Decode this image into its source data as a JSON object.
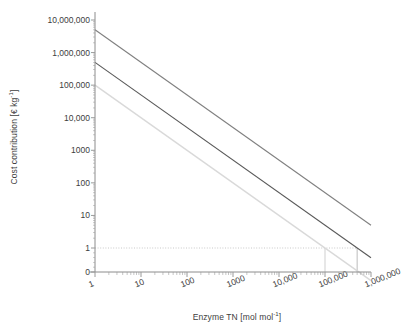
{
  "chart_data": {
    "type": "line",
    "title": "",
    "xlabel": "Enzyme TN [mol mol-1]",
    "xlabel_main": "Enzyme TN [mol mol",
    "xlabel_sup": "-1",
    "xlabel_tail": "]",
    "ylabel": "Cost contribution [€ kg-1]",
    "ylabel_main": "Cost contribution [€ kg",
    "ylabel_sup": "-1",
    "ylabel_tail": "]",
    "xscale": "log",
    "yscale": "log",
    "xlim": [
      1,
      1000000
    ],
    "ylim": [
      1,
      10000000
    ],
    "grid": false,
    "legend": "none",
    "xticklabels": [
      "1",
      "10",
      "100",
      "1000",
      "10,000",
      "100,000",
      "1,000,000"
    ],
    "xtickvalues": [
      1,
      10,
      100,
      1000,
      10000,
      100000,
      1000000
    ],
    "yticklabels": [
      "10,000,000",
      "1,000,000",
      "100,000",
      "10,000",
      "1000",
      "100",
      "10",
      "1",
      "0"
    ],
    "ytickvalues": [
      10000000,
      1000000,
      100000,
      10000,
      1000,
      100,
      10,
      1,
      0
    ],
    "series": [
      {
        "name": "high enzyme cost",
        "color": "#808080",
        "width": 1.1,
        "x": [
          1,
          1000000
        ],
        "y": [
          5000000,
          5
        ]
      },
      {
        "name": "medium enzyme cost",
        "color": "#595959",
        "width": 1.1,
        "x": [
          1,
          1000000
        ],
        "y": [
          500000,
          0.5
        ]
      },
      {
        "name": "low enzyme cost",
        "color": "#d9d9d9",
        "width": 1.4,
        "x": [
          1,
          1000000
        ],
        "y": [
          100000,
          0.1
        ]
      }
    ],
    "annotations": [
      {
        "name": "cost-threshold-line",
        "kind": "horizontal-reference",
        "y": 1,
        "style": "dotted",
        "color": "#c8c8c8",
        "x_from": 1,
        "x_to": 500000
      },
      {
        "name": "intersection-drop-line-low",
        "kind": "vertical-drop",
        "x": 100000,
        "style": "solid",
        "color": "#cfcfcf",
        "y_from": 1,
        "y_to": 0
      },
      {
        "name": "intersection-drop-line-medium",
        "kind": "vertical-drop",
        "x": 500000,
        "style": "solid",
        "color": "#bdbdbd",
        "y_from": 1,
        "y_to": 0
      }
    ]
  },
  "axes": {
    "tick_color": "#9a9a9a",
    "spine_color": "#8c8c8c"
  }
}
